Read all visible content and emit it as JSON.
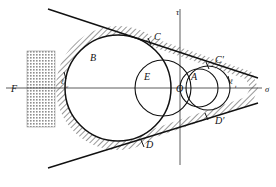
{
  "figure": {
    "background_color": "#ffffff",
    "stroke_color": "#111111",
    "hatch_color": "#8a8a8a",
    "stipple_color": "#9a9a9a",
    "axis_color": "#444444"
  },
  "axes": {
    "horizontal": {
      "name": "sigma-axis",
      "label": "σ",
      "label_x": 265,
      "label_y": 92,
      "y": 88,
      "x_start": 6,
      "x_end": 262
    },
    "vertical": {
      "name": "tau-axis",
      "label": "τ",
      "label_x": 176,
      "label_y": 15,
      "x": 180,
      "y_start": 9,
      "y_end": 165
    }
  },
  "circles": [
    {
      "name": "circle-B",
      "label": "B",
      "label_x": 90,
      "label_y": 61,
      "cx": 118,
      "cy": 88,
      "r": 53
    },
    {
      "name": "circle-E",
      "label": "E",
      "label_x": 144,
      "label_y": 80,
      "cx": 163,
      "cy": 88,
      "r": 28
    },
    {
      "name": "circle-A",
      "label": "A",
      "label_x": 191,
      "label_y": 80,
      "cx": 199,
      "cy": 88,
      "r": 19
    },
    {
      "name": "circle-right",
      "label": "",
      "label_x": 0,
      "label_y": 0,
      "cx": 208,
      "cy": 88,
      "r": 22
    }
  ],
  "points": [
    {
      "name": "point-O",
      "label": "O",
      "x": 176,
      "y": 92
    },
    {
      "name": "point-C",
      "label": "C",
      "x": 154,
      "y": 40
    },
    {
      "name": "point-C-prime",
      "label": "C′",
      "x": 215,
      "y": 63
    },
    {
      "name": "point-D",
      "label": "D",
      "x": 146,
      "y": 148
    },
    {
      "name": "point-D-prime",
      "label": "D′",
      "x": 215,
      "y": 124
    }
  ],
  "envelope_lines": [
    {
      "name": "envelope-line-upper",
      "x1": 48,
      "y1": 9,
      "x2": 258,
      "y2": 78
    },
    {
      "name": "envelope-line-lower",
      "x1": 48,
      "y1": 168,
      "x2": 258,
      "y2": 103
    }
  ],
  "hatched_band": {
    "name": "failure-envelope-band",
    "description": "hatched envelope band surrounding circle B"
  },
  "stipple_rect": {
    "name": "region-F-rectangle",
    "label": "F",
    "label_x": 11,
    "label_y": 92,
    "x": 27,
    "y": 51,
    "width": 28,
    "height": 76
  },
  "tangency_marks": [
    {
      "name": "tangency-label-left",
      "label": "ℓ",
      "sub": "c",
      "x": 61,
      "y": 84,
      "sub_x": 66,
      "sub_y": 88
    },
    {
      "name": "tangency-label-right",
      "label": "ℓ",
      "sub": "t",
      "x": 230,
      "y": 84,
      "sub_x": 235,
      "sub_y": 88
    }
  ]
}
